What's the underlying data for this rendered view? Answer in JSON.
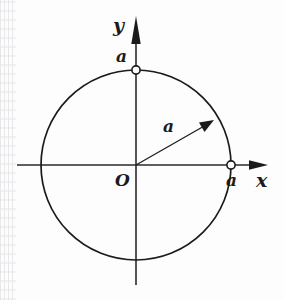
{
  "figure": {
    "type": "geometry-diagram",
    "background_color": "#fdfdfd",
    "stroke_color": "#1b1b1b"
  },
  "axes": {
    "x_label": "x",
    "y_label": "y",
    "origin_label": "O",
    "x_axis": {
      "from_px": 17,
      "to_px": 268,
      "y_px": 165,
      "arrow": "right"
    },
    "y_axis": {
      "from_px": 285,
      "to_px": 16,
      "x_px": 136,
      "arrow": "up"
    }
  },
  "circle": {
    "center_px": [
      136,
      165
    ],
    "radius_px": 95,
    "equation_radius_label": "a"
  },
  "radius_vector": {
    "label": "a",
    "from_px": [
      136,
      165
    ],
    "to_px": [
      212,
      122
    ],
    "arrow": "outward",
    "angle_deg": 29
  },
  "markers": [
    {
      "name": "y-intercept",
      "label": "a",
      "at_px": [
        136,
        70
      ],
      "style": "open-circle"
    },
    {
      "name": "x-intercept",
      "label": "a",
      "at_px": [
        231,
        165
      ],
      "style": "open-circle"
    }
  ],
  "labels": {
    "y_axis": "y",
    "x_axis": "x",
    "origin": "O",
    "y_intercept_value": "a",
    "x_intercept_value": "a",
    "radius_value": "a"
  }
}
